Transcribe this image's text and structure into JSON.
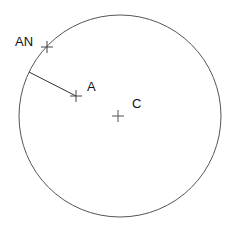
{
  "diagram": {
    "colors": {
      "stroke": "#555555",
      "text": "#111111",
      "background": "#ffffff"
    },
    "circle": {
      "cx": 120,
      "cy": 116,
      "r": 101
    },
    "points": [
      {
        "id": "AN",
        "label": "AN",
        "x": 47,
        "y": 47
      },
      {
        "id": "A",
        "label": "A",
        "x": 76,
        "y": 96
      },
      {
        "id": "C",
        "label": "C",
        "x": 118,
        "y": 116
      }
    ],
    "segment": {
      "from": [
        29,
        72
      ],
      "to": [
        76,
        96
      ]
    },
    "labels": {
      "an": "AN",
      "a": "A",
      "c": "C"
    }
  }
}
